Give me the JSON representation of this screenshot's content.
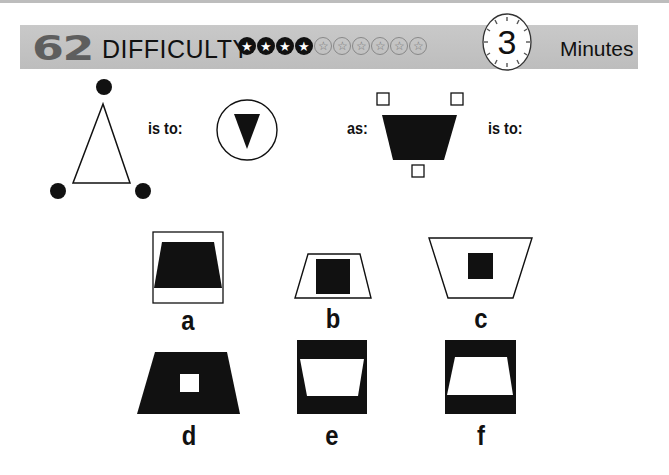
{
  "header": {
    "puzzle_number": "62",
    "difficulty_label": "DIFFICULTY",
    "difficulty_rating": 4,
    "difficulty_max": 10,
    "stars": [
      "filled",
      "filled",
      "filled",
      "filled",
      "empty",
      "empty",
      "empty",
      "empty",
      "empty",
      "empty"
    ],
    "time_value": "3",
    "time_unit": "Minutes",
    "colors": {
      "banner": "#c4c4c4",
      "puzzle_number": "#5e5e5e",
      "text": "#111111"
    }
  },
  "question": {
    "connector_1": "is to:",
    "connector_2": "as:",
    "connector_3": "is to:",
    "figure_1": "outline triangle with three black dots at vertices",
    "figure_2": "black inverted triangle inside circle",
    "figure_3": "black inverted trapezoid with three small outline squares"
  },
  "options": [
    {
      "letter": "a",
      "description": "black trapezoid inside outline square"
    },
    {
      "letter": "b",
      "description": "black square inside outline trapezoid"
    },
    {
      "letter": "c",
      "description": "small black square inside large inverted outline trapezoid"
    },
    {
      "letter": "d",
      "description": "white square inside black trapezoid"
    },
    {
      "letter": "e",
      "description": "white inverted trapezoid inside black square"
    },
    {
      "letter": "f",
      "description": "white trapezoid inside black square"
    }
  ]
}
